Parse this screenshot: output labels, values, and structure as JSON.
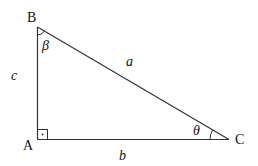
{
  "diagram": {
    "type": "right-triangle",
    "vertices": [
      {
        "id": "A",
        "label": "A"
      },
      {
        "id": "B",
        "label": "B"
      },
      {
        "id": "C",
        "label": "C"
      }
    ],
    "sides": {
      "a": "a",
      "b": "b",
      "c": "c"
    },
    "angles": {
      "beta": "β",
      "theta": "θ"
    },
    "right_angle_at": "A"
  }
}
